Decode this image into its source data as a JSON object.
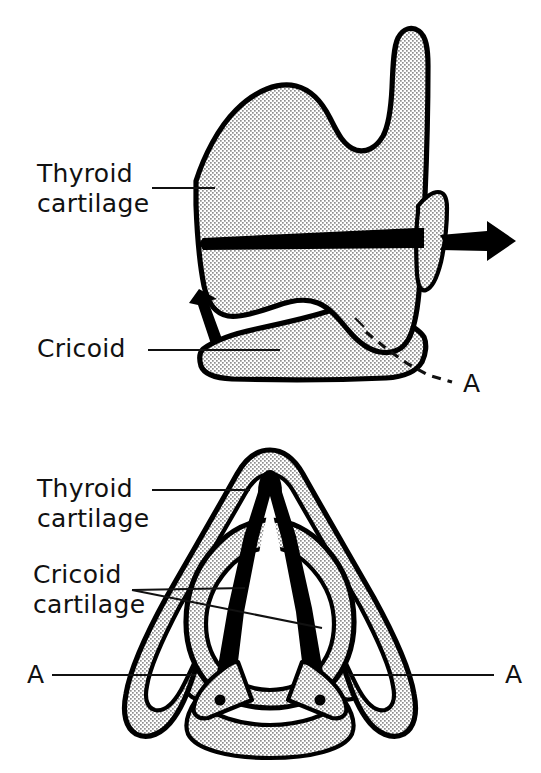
{
  "figure": {
    "background_color": "#ffffff",
    "ink_color": "#000000",
    "stipple_fill_color": "#9a9a9a"
  },
  "panels": [
    {
      "id": "lateral-view",
      "view_name": "lateral-view",
      "labels": [
        {
          "id": "thyroid",
          "line1": "Thyroid",
          "line2": "cartilage"
        },
        {
          "id": "cricoid",
          "line1": "Cricoid",
          "line2": ""
        },
        {
          "id": "section-marker",
          "line1": "A",
          "line2": ""
        }
      ],
      "annotations": {
        "arrow_right_name": "traction-arrow-right",
        "arrow_up_name": "traction-arrow-up",
        "blade_name": "horizontal-blade"
      }
    },
    {
      "id": "superior-view",
      "view_name": "superior-view",
      "labels": [
        {
          "id": "thyroid",
          "line1": "Thyroid",
          "line2": "cartilage"
        },
        {
          "id": "cricoid",
          "line1": "Cricoid",
          "line2": "cartilage"
        },
        {
          "id": "section-marker-left",
          "line1": "A",
          "line2": ""
        },
        {
          "id": "section-marker-right",
          "line1": "A",
          "line2": ""
        }
      ]
    }
  ],
  "text": {
    "thyroid_line1": "Thyroid",
    "thyroid_line2": "cartilage",
    "cricoid_line1": "Cricoid",
    "cricoid_line2": "cartilage",
    "cricoid_top_only": "Cricoid",
    "section_letter": "A"
  }
}
